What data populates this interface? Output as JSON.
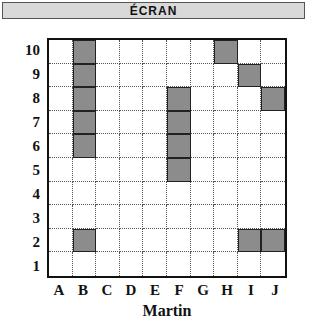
{
  "header": {
    "title": "ÉCRAN"
  },
  "grid": {
    "columns": [
      "A",
      "B",
      "C",
      "D",
      "E",
      "F",
      "G",
      "H",
      "I",
      "J"
    ],
    "rows": [
      "10",
      "9",
      "8",
      "7",
      "6",
      "5",
      "4",
      "3",
      "2",
      "1"
    ],
    "filled_cells": [
      "B10",
      "B9",
      "B8",
      "B7",
      "B6",
      "H10",
      "I9",
      "J8",
      "F8",
      "F7",
      "F6",
      "F5",
      "B2",
      "I2",
      "J2"
    ],
    "fill_color": "#8c8c8c"
  },
  "footer": {
    "player_name": "Martin"
  }
}
